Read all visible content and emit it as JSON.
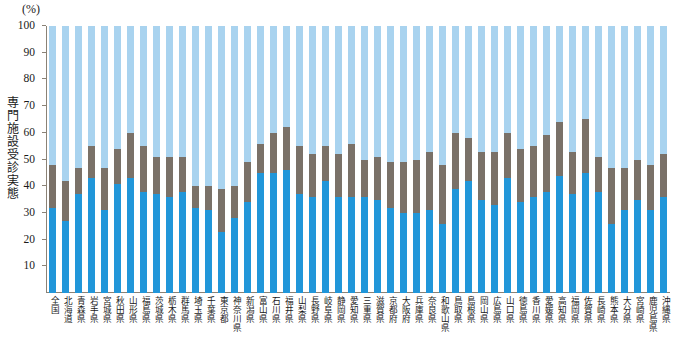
{
  "chart_data": {
    "type": "bar",
    "stacked": true,
    "title": "",
    "subtitle": "",
    "unit_label": "(%)",
    "ylabel": "専門施設受診実態",
    "xlabel": "",
    "ylim": [
      0,
      100
    ],
    "ytick_labels": [
      "10",
      "20",
      "30",
      "40",
      "50",
      "60",
      "70",
      "80",
      "90",
      "100"
    ],
    "yticks": [
      10,
      20,
      30,
      40,
      50,
      60,
      70,
      80,
      90,
      100
    ],
    "grid": false,
    "legend_position": "none",
    "colors": {
      "series1": "#2196d9",
      "series2": "#7a7168",
      "series3": "#a9d3ef",
      "axis": "#8a8276",
      "text": "#1a1a1a",
      "background": "#ffffff"
    },
    "categories": [
      "全国",
      "北海道",
      "青森県",
      "岩手県",
      "宮城県",
      "秋田県",
      "山形県",
      "福島県",
      "茨城県",
      "栃木県",
      "群馬県",
      "埼玉県",
      "千葉県",
      "東京都",
      "神奈川県",
      "新潟県",
      "富山県",
      "石川県",
      "福井県",
      "山梨県",
      "長野県",
      "岐阜県",
      "静岡県",
      "愛知県",
      "三重県",
      "滋賀県",
      "京都府",
      "大阪府",
      "兵庫県",
      "奈良県",
      "和歌山県",
      "鳥取県",
      "島根県",
      "岡山県",
      "広島県",
      "山口県",
      "徳島県",
      "香川県",
      "愛媛県",
      "高知県",
      "福岡県",
      "佐賀県",
      "長崎県",
      "熊本県",
      "大分県",
      "宮崎県",
      "鹿児島県",
      "沖縄県"
    ],
    "series": [
      {
        "name": "series1",
        "color": "#2196d9",
        "values": [
          32,
          27,
          37,
          43,
          31,
          41,
          43,
          38,
          37,
          36,
          38,
          32,
          31,
          23,
          28,
          34,
          45,
          45,
          46,
          37,
          36,
          42,
          36,
          36,
          36,
          35,
          32,
          30,
          30,
          31,
          26,
          39,
          42,
          35,
          33,
          43,
          34,
          36,
          38,
          44,
          37,
          45,
          38,
          26,
          31,
          35,
          31,
          36
        ]
      },
      {
        "name": "series2",
        "color": "#7a7168",
        "values": [
          16,
          15,
          10,
          12,
          16,
          13,
          17,
          17,
          14,
          15,
          13,
          8,
          9,
          16,
          12,
          15,
          11,
          15,
          16,
          18,
          16,
          13,
          16,
          20,
          14,
          16,
          17,
          19,
          20,
          22,
          22,
          21,
          16,
          18,
          20,
          17,
          20,
          19,
          21,
          20,
          16,
          20,
          13,
          21,
          16,
          15,
          17,
          16
        ]
      },
      {
        "name": "series3",
        "color": "#a9d3ef",
        "values": [
          52,
          58,
          53,
          45,
          53,
          46,
          40,
          45,
          49,
          49,
          49,
          60,
          60,
          61,
          60,
          51,
          44,
          40,
          38,
          45,
          48,
          45,
          48,
          44,
          50,
          49,
          51,
          51,
          50,
          47,
          52,
          40,
          42,
          47,
          47,
          40,
          46,
          45,
          41,
          36,
          47,
          35,
          49,
          53,
          53,
          50,
          52,
          48
        ]
      }
    ]
  }
}
